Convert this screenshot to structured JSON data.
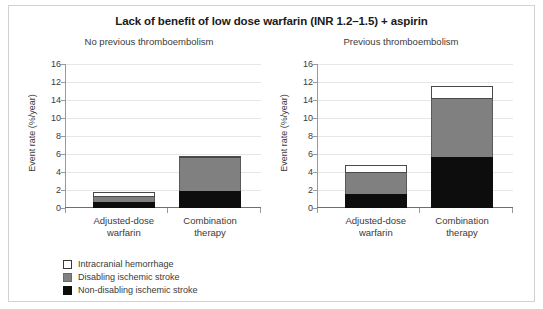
{
  "chart_data": {
    "type": "bar",
    "title": "Lack of benefit of low dose warfarin (INR 1.2–1.5) + aspirin",
    "xlabel": "",
    "ylabel": "Event rate (%/year)",
    "ylim": [
      0,
      16
    ],
    "grid": true,
    "stacked": true,
    "legend_position": "bottom-left",
    "tick_labels": [
      "0",
      "2",
      "4",
      "6",
      "8",
      "10",
      "14",
      "12",
      "16"
    ],
    "tick_values": [
      0,
      2,
      4,
      6,
      8,
      10,
      12,
      14,
      16
    ],
    "categories": [
      "Adjusted-dose warfarin",
      "Combination therapy"
    ],
    "series": [
      {
        "name": "Non-disabling ischemic stroke",
        "color": "#0d0d0d"
      },
      {
        "name": "Disabling ischemic stroke",
        "color": "#808080"
      },
      {
        "name": "Intracranial hemorrhage",
        "color": "#ffffff"
      }
    ],
    "panels": [
      {
        "subtitle": "No previous thromboembolism",
        "series": [
          {
            "name": "Non-disabling ischemic stroke",
            "values": [
              0.7,
              1.9
            ]
          },
          {
            "name": "Disabling ischemic stroke",
            "values": [
              0.5,
              3.65
            ]
          },
          {
            "name": "Intracranial hemorrhage",
            "values": [
              0.6,
              0.25
            ]
          }
        ],
        "totals": [
          1.8,
          5.8
        ]
      },
      {
        "subtitle": "Previous thromboembolism",
        "series": [
          {
            "name": "Non-disabling ischemic stroke",
            "values": [
              1.6,
              5.7
            ]
          },
          {
            "name": "Disabling ischemic stroke",
            "values": [
              2.3,
              6.4
            ]
          },
          {
            "name": "Intracranial hemorrhage",
            "values": [
              0.9,
              1.5
            ]
          }
        ],
        "totals": [
          4.8,
          13.6
        ]
      }
    ]
  },
  "title": "Lack of benefit of low dose warfarin (INR 1.2–1.5) + aspirin",
  "panels": [
    {
      "subtitle": "No previous thromboembolism"
    },
    {
      "subtitle": "Previous thromboembolism"
    }
  ],
  "axis": {
    "ylabel": "Event rate (%/year)"
  },
  "categories": [
    {
      "line1": "Adjusted-dose",
      "line2": "warfarin"
    },
    {
      "line1": "Combination",
      "line2": "therapy"
    }
  ],
  "legend": [
    {
      "label": "Intracranial hemorrhage",
      "color": "#ffffff"
    },
    {
      "label": "Disabling ischemic stroke",
      "color": "#808080"
    },
    {
      "label": "Non-disabling ischemic stroke",
      "color": "#0d0d0d"
    }
  ]
}
